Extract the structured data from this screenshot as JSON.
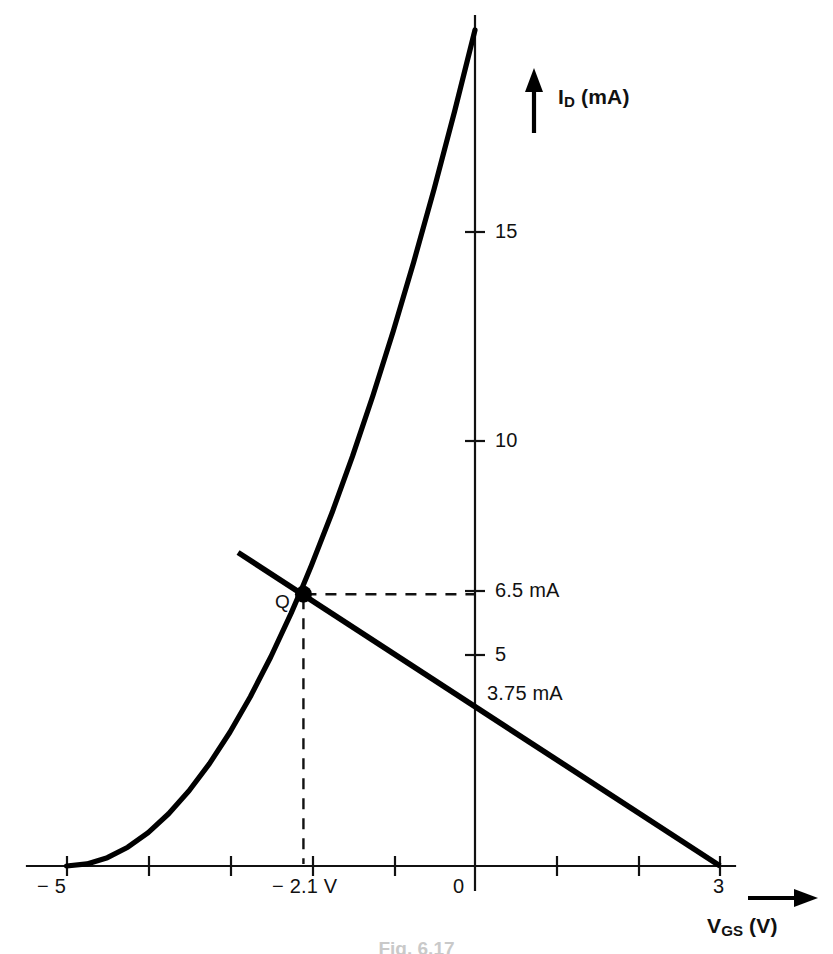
{
  "figure": {
    "caption": "Fig. 6.17",
    "background_color": "#ffffff",
    "ink_color": "#000000"
  },
  "axes": {
    "y_axis_label": "I",
    "y_axis_label_sub": "D",
    "y_axis_label_units": " (mA)",
    "x_axis_label": "V",
    "x_axis_label_sub": "GS",
    "x_axis_label_units": " (V)",
    "y_arrow_icon": "up-arrow-icon",
    "x_arrow_icon": "right-arrow-icon"
  },
  "ticks": {
    "x_labeled": [
      {
        "value": -5,
        "label": "− 5"
      },
      {
        "value": -2.1,
        "label": "− 2.1 V"
      },
      {
        "value": 0,
        "label": "0"
      },
      {
        "value": 3,
        "label": "3"
      }
    ],
    "x_unlabeled": [
      -4,
      -3,
      -2,
      -1,
      1,
      2
    ],
    "y_labeled": [
      {
        "value": 15,
        "label": "15"
      },
      {
        "value": 10,
        "label": "10"
      },
      {
        "value": 6.5,
        "label": "6.5 mA"
      },
      {
        "value": 5,
        "label": "5"
      }
    ]
  },
  "annotations": {
    "q_point_label": "Q",
    "load_line_intercept_label": "3.75 mA"
  },
  "chart_data": {
    "type": "line",
    "title": "",
    "subtitle": "",
    "xlabel": "V_GS (V)",
    "ylabel": "I_D (mA)",
    "xlim": [
      -5.5,
      4.4
    ],
    "ylim": [
      0,
      20.5
    ],
    "grid": false,
    "legend": null,
    "x_ticks": [
      -5,
      -4,
      -3,
      -2,
      -1,
      0,
      1,
      2,
      3
    ],
    "x_tick_labels": [
      "− 5",
      "",
      "",
      "",
      "",
      "0",
      "",
      "",
      "3"
    ],
    "y_ticks": [
      5,
      6.5,
      10,
      15
    ],
    "y_tick_labels": [
      "5",
      "6.5 mA",
      "10",
      "15"
    ],
    "series": [
      {
        "name": "JFET transfer characteristic (Shockley)",
        "type": "curve",
        "equation": "ID = IDSS * (1 - VGS/VP)^2",
        "IDSS_mA": 20,
        "VP_V": -5,
        "x": [
          -5.0,
          -4.75,
          -4.5,
          -4.25,
          -4.0,
          -3.75,
          -3.5,
          -3.25,
          -3.0,
          -2.75,
          -2.5,
          -2.25,
          -2.1,
          -2.0,
          -1.75,
          -1.5,
          -1.25,
          -1.0,
          -0.75,
          -0.5,
          -0.25,
          0.0
        ],
        "y": [
          0.0,
          0.05,
          0.2,
          0.45,
          0.8,
          1.25,
          1.8,
          2.45,
          3.2,
          4.05,
          5.0,
          6.05,
          6.73,
          7.2,
          8.45,
          9.8,
          11.25,
          12.8,
          14.45,
          16.2,
          18.05,
          20.0
        ]
      },
      {
        "name": "DC bias load line",
        "type": "line",
        "x": [
          -2.9,
          3.0
        ],
        "y": [
          7.5,
          0.0
        ],
        "y_intercept_mA": 3.75,
        "x_intercept_V": 3.0
      }
    ],
    "points": [
      {
        "name": "Q",
        "label": "Q",
        "x": -2.1,
        "y": 6.5,
        "x_label": "− 2.1 V",
        "y_label": "6.5 mA",
        "marker": "filled-circle"
      }
    ],
    "guides": [
      {
        "type": "dashed-horizontal",
        "from_x": -2.1,
        "to_x": 0,
        "y": 6.5
      },
      {
        "type": "dashed-vertical",
        "x": -2.1,
        "from_y": 6.5,
        "to_y": 0
      }
    ]
  }
}
